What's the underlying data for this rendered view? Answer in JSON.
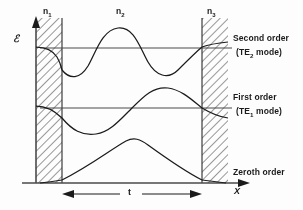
{
  "figure": {
    "axes": {
      "y_label": "ℰ",
      "y_label_name": "electric-field-amplitude",
      "x_label": "X",
      "thickness_label": "t"
    },
    "regions": [
      {
        "id": "n1",
        "label": "n",
        "sub": "1",
        "kind": "cladding",
        "hatched": true,
        "x_start": 36,
        "x_end": 62,
        "label_x": 46,
        "label_y": 8
      },
      {
        "id": "n2",
        "label": "n",
        "sub": "2",
        "kind": "guide",
        "hatched": false,
        "x_start": 62,
        "x_end": 202,
        "label_x": 119,
        "label_y": 8
      },
      {
        "id": "n3",
        "label": "n",
        "sub": "3",
        "kind": "cladding",
        "hatched": true,
        "x_start": 202,
        "x_end": 228,
        "label_x": 210,
        "label_y": 8
      }
    ],
    "modes": [
      {
        "id": "second-order",
        "line1": "Second order",
        "line2_pre": "(TE",
        "line2_sub": "2",
        "line2_post": " mode)",
        "label_x": 233,
        "label_y1": 38,
        "label_y2": 52,
        "baseline_y": 48,
        "half_cycles": 3,
        "amplitude": 26
      },
      {
        "id": "first-order",
        "line1": "First order",
        "line2_pre": "(TE",
        "line2_sub": "1",
        "line2_post": " mode)",
        "label_x": 233,
        "label_y1": 97,
        "label_y2": 111,
        "baseline_y": 108,
        "half_cycles": 2,
        "amplitude": 24
      },
      {
        "id": "zeroth-order",
        "line1": "Zeroth order",
        "line2_pre": "",
        "line2_sub": "",
        "line2_post": "",
        "label_x": 233,
        "label_y1": 172,
        "label_y2": 0,
        "baseline_y": 183,
        "half_cycles": 1,
        "amplitude": 44
      }
    ],
    "colors": {
      "ink": "#1b1b1b",
      "line": "#2a2a2a",
      "hatch": "#3a3a3a",
      "paper": "#fdfdfc"
    },
    "geometry": {
      "axis_x": 36,
      "axis_top_y": 18,
      "axis_bottom_y": 183,
      "x_arrow_end": 248,
      "x_label_x": 236,
      "x_label_y": 188,
      "e_label_x": 17,
      "e_label_y": 40,
      "t_arrow_y": 194,
      "t_label_x": 128,
      "t_label_y": 188
    }
  }
}
